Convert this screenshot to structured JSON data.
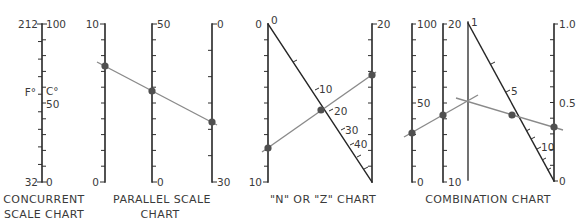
{
  "figure": {
    "type": "nomogram-types",
    "colors": {
      "axis": "#262626",
      "isopleth": "#8a8a8a",
      "dot": "#505050",
      "text": "#3a3a3a"
    }
  },
  "charts": [
    {
      "title_lines": [
        "CONCURRENT",
        "SCALE CHART"
      ],
      "left_scale": {
        "unit": "F°",
        "top": "212",
        "bottom": "32",
        "tick_intervals": 9
      },
      "right_scale": {
        "unit": "C°",
        "top": "100",
        "mid": "50",
        "bottom": "0",
        "tick_intervals": 10
      }
    },
    {
      "title_lines": [
        "PARALLEL SCALE",
        "CHART"
      ],
      "axes": [
        {
          "top": "10",
          "bottom": "0",
          "tick_intervals": 10
        },
        {
          "top": "50",
          "bottom": "0",
          "tick_intervals": 10
        },
        {
          "top": "0",
          "bottom": "30",
          "tick_intervals": 6
        }
      ],
      "isopleth_readings_estimated": [
        7.3,
        28.8,
        18.6
      ]
    },
    {
      "title_lines": [
        "\"N\" OR \"Z\" CHART"
      ],
      "axes": [
        {
          "top": "0",
          "bottom": "10",
          "tick_intervals": 10
        },
        {
          "top": "20",
          "tick_intervals": 10
        }
      ],
      "diagonal": {
        "labels": [
          "0",
          "10",
          "20",
          "30",
          "40"
        ]
      },
      "isopleth_readings_estimated": {
        "left": 7.8,
        "diagonal": 20,
        "right": 14.5
      }
    },
    {
      "title_lines": [
        "COMBINATION CHART"
      ],
      "axes": [
        {
          "top": "100",
          "mid": "50",
          "bottom": "0",
          "tick_intervals": 10
        },
        {
          "top": "20",
          "bottom": "10",
          "tick_intervals": 10
        },
        {
          "type": "turning line (unscaled)"
        },
        {
          "top": "1.0",
          "mid": "0.5",
          "bottom": "0",
          "tick_intervals": 10
        }
      ],
      "diagonal": {
        "labels": [
          "1",
          "5",
          "10"
        ]
      },
      "isopleth_readings_estimated": {
        "axis_a": 31,
        "axis_b": 14.3,
        "right": 0.35
      }
    }
  ]
}
